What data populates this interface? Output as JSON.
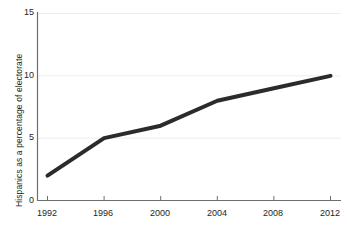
{
  "chart_data": {
    "type": "line",
    "title": "",
    "subtitle": "",
    "xlabel": "",
    "ylabel": "Hispanics as a percentage of electorate",
    "x": [
      1992,
      1996,
      2000,
      2004,
      2008,
      2012
    ],
    "values": [
      2,
      5,
      6,
      8,
      9,
      10
    ],
    "series": [
      {
        "name": "Hispanics as a percentage of electorate",
        "values": [
          2,
          5,
          6,
          8,
          9,
          10
        ],
        "color": "#2b2b2b"
      }
    ],
    "xtick_labels": [
      "1992",
      "1996",
      "2000",
      "2004",
      "2008",
      "2012"
    ],
    "ytick_labels": [
      "0",
      "5",
      "10",
      "15"
    ],
    "yticks": [
      0,
      5,
      10,
      15
    ],
    "xlim": [
      1992,
      2012
    ],
    "ylim": [
      0,
      15
    ],
    "grid": "horizontal",
    "legend": "none",
    "annotations": []
  },
  "axis": {
    "y_title": "Hispanics as a percentage of electorate",
    "y_labels": {
      "t0": "0",
      "t5": "5",
      "t10": "10",
      "t15": "15"
    },
    "x_labels": {
      "t1992": "1992",
      "t1996": "1996",
      "t2000": "2000",
      "t2004": "2004",
      "t2008": "2008",
      "t2012": "2012"
    }
  },
  "colors": {
    "line": "#2b2b2b",
    "axis": "#6d6e71",
    "grid": "#ededed",
    "text": "#231f20",
    "background": "#ffffff"
  }
}
